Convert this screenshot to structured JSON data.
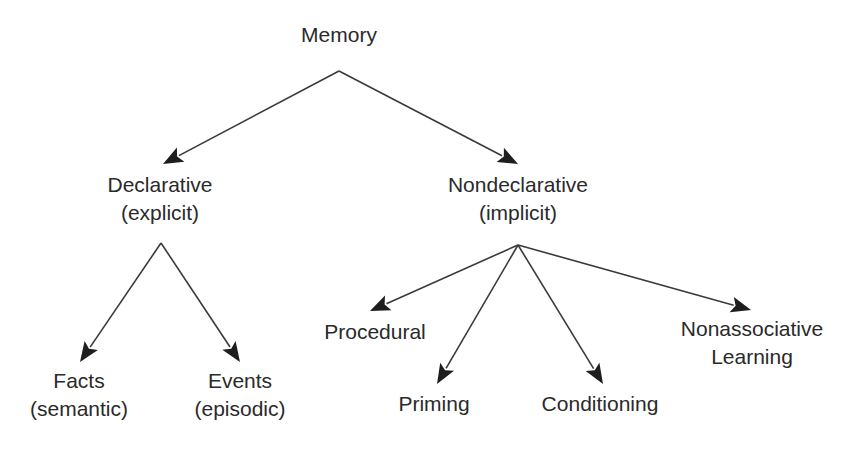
{
  "diagram": {
    "type": "tree",
    "title": "",
    "root": {
      "id": "memory",
      "lines": [
        "Memory"
      ]
    },
    "nodes": [
      {
        "id": "memory",
        "lines": [
          "Memory"
        ],
        "x": 339,
        "y": [
          42
        ]
      },
      {
        "id": "declarative",
        "lines": [
          "Declarative",
          "(explicit)"
        ],
        "x": 160,
        "y": [
          192,
          220
        ]
      },
      {
        "id": "nondeclarative",
        "lines": [
          "Nondeclarative",
          "(implicit)"
        ],
        "x": 518,
        "y": [
          192,
          220
        ]
      },
      {
        "id": "facts",
        "lines": [
          "Facts",
          "(semantic)"
        ],
        "x": 79,
        "y": [
          388,
          416
        ]
      },
      {
        "id": "events",
        "lines": [
          "Events",
          "(episodic)"
        ],
        "x": 240,
        "y": [
          388,
          416
        ]
      },
      {
        "id": "procedural",
        "lines": [
          "Procedural"
        ],
        "x": 375,
        "y": [
          339
        ]
      },
      {
        "id": "priming",
        "lines": [
          "Priming"
        ],
        "x": 434,
        "y": [
          411
        ]
      },
      {
        "id": "conditioning",
        "lines": [
          "Conditioning"
        ],
        "x": 600,
        "y": [
          411
        ]
      },
      {
        "id": "nonassociative",
        "lines": [
          "Nonassociative",
          "Learning"
        ],
        "x": 752,
        "y": [
          336,
          364
        ]
      }
    ],
    "edges": [
      {
        "from": "memory",
        "to": "declarative",
        "x1": 339,
        "y1": 71,
        "x2": 163,
        "y2": 164
      },
      {
        "from": "memory",
        "to": "nondeclarative",
        "x1": 339,
        "y1": 71,
        "x2": 518,
        "y2": 164
      },
      {
        "from": "declarative",
        "to": "facts",
        "x1": 161,
        "y1": 243,
        "x2": 80,
        "y2": 362
      },
      {
        "from": "declarative",
        "to": "events",
        "x1": 161,
        "y1": 243,
        "x2": 240,
        "y2": 362
      },
      {
        "from": "nondeclarative",
        "to": "procedural",
        "x1": 518,
        "y1": 245,
        "x2": 370,
        "y2": 311
      },
      {
        "from": "nondeclarative",
        "to": "priming",
        "x1": 518,
        "y1": 245,
        "x2": 437,
        "y2": 384
      },
      {
        "from": "nondeclarative",
        "to": "conditioning",
        "x1": 518,
        "y1": 245,
        "x2": 603,
        "y2": 384
      },
      {
        "from": "nondeclarative",
        "to": "nonassociative",
        "x1": 518,
        "y1": 245,
        "x2": 751,
        "y2": 310
      }
    ],
    "colors": {
      "text": "#2a2a2a",
      "line": "#3a3a3a",
      "arrowhead": "#1e1e1e",
      "background": "#ffffff"
    }
  }
}
